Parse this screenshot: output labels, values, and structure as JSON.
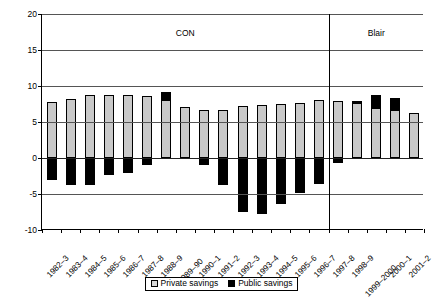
{
  "chart_data": {
    "type": "bar",
    "subtype": "stacked-bar",
    "title": "",
    "xlabel": "",
    "ylabel": "",
    "ylim": [
      -10,
      20
    ],
    "yticks": [
      20,
      15,
      10,
      5,
      0,
      -5,
      -10
    ],
    "ytick_labels": [
      "20",
      "15",
      "10",
      "5",
      "0",
      "-5",
      "-10"
    ],
    "grid": true,
    "legend_position": "bottom",
    "categories": [
      "1982–3",
      "1983–4",
      "1984–5",
      "1985–6",
      "1986–7",
      "1987–8",
      "1988–9",
      "1989–90",
      "1990–1",
      "1991–2",
      "1992–3",
      "1993–4",
      "1994–5",
      "1995–6",
      "1996–7",
      "1997–8",
      "1998–9",
      "1999–2000",
      "2000–1",
      "2001–2"
    ],
    "series": [
      {
        "name": "Private savings",
        "color": "#c9c9c9",
        "values": [
          7.8,
          8.2,
          8.7,
          8.7,
          8.7,
          8.6,
          8.0,
          7.1,
          6.6,
          6.7,
          7.2,
          7.3,
          7.5,
          7.7,
          8.0,
          7.9,
          7.7,
          7.0,
          6.6,
          6.2
        ]
      },
      {
        "name": "Public savings",
        "color": "#000000",
        "values": [
          -3.0,
          -3.8,
          -3.7,
          -2.4,
          -2.1,
          -1.0,
          1.2,
          0.0,
          -1.0,
          -3.8,
          -7.5,
          -7.8,
          -6.4,
          -4.8,
          -3.6,
          -0.7,
          0.2,
          1.7,
          1.8,
          0.0
        ]
      }
    ],
    "annotations": [
      {
        "text": "CON",
        "type": "era-label",
        "span_start": "1982–3",
        "span_end": "1996–7"
      },
      {
        "text": "Blair",
        "type": "era-label",
        "span_start": "1997–8",
        "span_end": "2001–2"
      }
    ],
    "divider": {
      "after_category": "1996–7",
      "label_left": "CON",
      "label_right": "Blair"
    },
    "legend": [
      {
        "label": "Private savings",
        "swatch": "private-swatch",
        "color": "#c9c9c9"
      },
      {
        "label": "Public savings",
        "swatch": "public-swatch",
        "color": "#000000"
      }
    ]
  }
}
